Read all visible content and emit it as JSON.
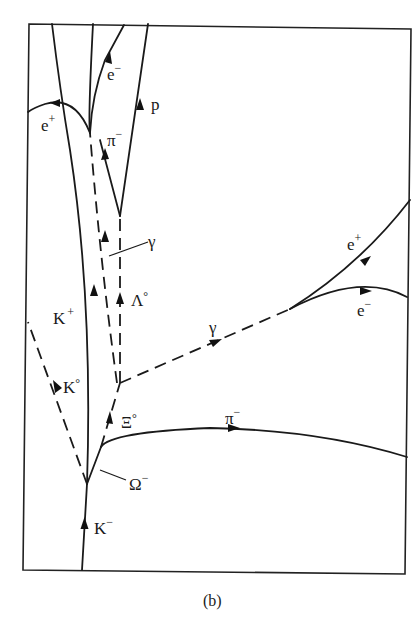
{
  "figure": {
    "caption": "(b)",
    "labels": {
      "e_plus_top": {
        "base": "e",
        "sup": "+"
      },
      "e_minus_top": {
        "base": "e",
        "sup": "−"
      },
      "p": {
        "base": "p",
        "sup": ""
      },
      "pi_minus_top": {
        "base": "π",
        "sup": "−"
      },
      "gamma_top": {
        "base": "γ",
        "sup": ""
      },
      "lambda0": {
        "base": "Λ",
        "sup": "°"
      },
      "k_plus": {
        "base": "K",
        "sup": "+"
      },
      "k0": {
        "base": "K",
        "sup": "°"
      },
      "xi0": {
        "base": "Ξ",
        "sup": "°"
      },
      "omega_minus": {
        "base": "Ω",
        "sup": "−"
      },
      "k_minus": {
        "base": "K",
        "sup": "−"
      },
      "gamma_right": {
        "base": "γ",
        "sup": ""
      },
      "e_plus_right": {
        "base": "e",
        "sup": "+"
      },
      "e_minus_right": {
        "base": "e",
        "sup": "−"
      },
      "pi_minus_right": {
        "base": "π",
        "sup": "−"
      }
    }
  }
}
